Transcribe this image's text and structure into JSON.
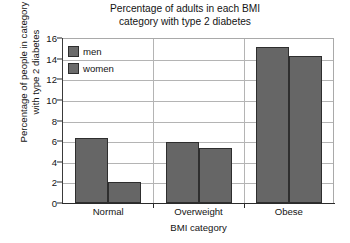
{
  "chart_data": {
    "type": "bar",
    "title": "Percentage of adults in each BMI\ncategory with type 2 diabetes",
    "xlabel": "BMI category",
    "ylabel": "Percentage of people in category\nwith type 2 diabetes",
    "categories": [
      "Normal",
      "Overweight",
      "Obese"
    ],
    "series": [
      {
        "name": "men",
        "values": [
          6.3,
          5.9,
          15.1
        ],
        "color": "#666666"
      },
      {
        "name": "women",
        "values": [
          2.0,
          5.3,
          14.3
        ],
        "color": "#666666"
      }
    ],
    "ylim": [
      0,
      16
    ],
    "yticks": [
      0,
      2,
      4,
      6,
      8,
      10,
      12,
      14,
      16
    ],
    "ytick_labels": [
      "0",
      "2",
      "4",
      "6",
      "8",
      "10",
      "12",
      "14",
      "16"
    ],
    "grid": true,
    "legend_position": "top-left",
    "bar_edge_color": "#2e2e2e",
    "grid_color": "#b4b4b4",
    "axis_color": "#2b2b2b",
    "background": "#ffffff"
  },
  "legend": {
    "items": [
      {
        "label": "men"
      },
      {
        "label": "women"
      }
    ]
  },
  "axis": {
    "y_tick_0": "0",
    "y_tick_1": "2",
    "y_tick_2": "4",
    "y_tick_3": "6",
    "y_tick_4": "8",
    "y_tick_5": "10",
    "y_tick_6": "12",
    "y_tick_7": "14",
    "y_tick_8": "16"
  },
  "categories": {
    "cat_0": "Normal",
    "cat_1": "Overweight",
    "cat_2": "Obese"
  }
}
